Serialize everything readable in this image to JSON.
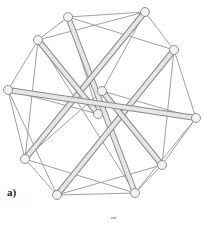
{
  "figure": {
    "label": "a)",
    "nodes": [
      {
        "id": "n1",
        "x": 68,
        "y": 17
      },
      {
        "id": "n2",
        "x": 145,
        "y": 12
      },
      {
        "id": "n3",
        "x": 38,
        "y": 40
      },
      {
        "id": "n4",
        "x": 174,
        "y": 50
      },
      {
        "id": "n5",
        "x": 8,
        "y": 90
      },
      {
        "id": "n6",
        "x": 102,
        "y": 91
      },
      {
        "id": "n7",
        "x": 98,
        "y": 114
      },
      {
        "id": "n8",
        "x": 196,
        "y": 118
      },
      {
        "id": "n9",
        "x": 25,
        "y": 159
      },
      {
        "id": "n10",
        "x": 162,
        "y": 165
      },
      {
        "id": "n11",
        "x": 57,
        "y": 195
      },
      {
        "id": "n12",
        "x": 135,
        "y": 193
      }
    ],
    "rods": [
      [
        "n1",
        "n12"
      ],
      [
        "n2",
        "n9"
      ],
      [
        "n3",
        "n7"
      ],
      [
        "n4",
        "n11"
      ],
      [
        "n6",
        "n10"
      ],
      [
        "n5",
        "n8"
      ]
    ],
    "thin_edges": [
      [
        "n1",
        "n2"
      ],
      [
        "n1",
        "n3"
      ],
      [
        "n2",
        "n4"
      ],
      [
        "n3",
        "n5"
      ],
      [
        "n4",
        "n8"
      ],
      [
        "n8",
        "n10"
      ],
      [
        "n10",
        "n12"
      ],
      [
        "n12",
        "n11"
      ],
      [
        "n11",
        "n9"
      ],
      [
        "n9",
        "n5"
      ],
      [
        "n3",
        "n2"
      ],
      [
        "n1",
        "n4"
      ],
      [
        "n2",
        "n6"
      ],
      [
        "n4",
        "n10"
      ],
      [
        "n5",
        "n7"
      ],
      [
        "n3",
        "n9"
      ],
      [
        "n5",
        "n11"
      ],
      [
        "n9",
        "n12"
      ],
      [
        "n11",
        "n10"
      ],
      [
        "n8",
        "n12"
      ],
      [
        "n6",
        "n8"
      ],
      [
        "n1",
        "n7"
      ],
      [
        "n3",
        "n12"
      ],
      [
        "n9",
        "n6"
      ]
    ],
    "colors": {
      "rod_fill": "#e6e6e6",
      "rod_edge": "#8a8a8a",
      "thin": "#a0a0a0",
      "node_fill": "#f2f2f2",
      "node_edge": "#777777"
    }
  }
}
